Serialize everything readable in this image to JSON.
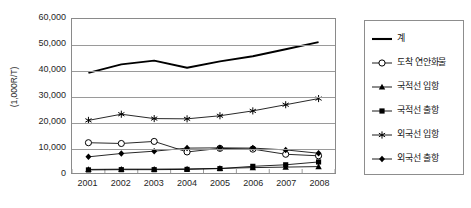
{
  "chart_data": {
    "type": "line",
    "title": "",
    "xlabel": "",
    "ylabel": "(1,000R/T)",
    "categories": [
      "2001",
      "2002",
      "2003",
      "2004",
      "2005",
      "2006",
      "2007",
      "2008"
    ],
    "ylim": [
      0,
      60000
    ],
    "ytick_labels": [
      "60,000",
      "50,000",
      "40,000",
      "30,000",
      "20,000",
      "10,000",
      "0"
    ],
    "ytick_values": [
      60000,
      50000,
      40000,
      30000,
      20000,
      10000,
      0
    ],
    "grid": true,
    "legend_position": "right",
    "series": [
      {
        "name": "계",
        "marker": "none",
        "color": "#000000",
        "values": [
          39000,
          42300,
          43800,
          41000,
          43500,
          45500,
          48200,
          51000
        ]
      },
      {
        "name": "도착 연안화물",
        "marker": "open-circle",
        "color": "#000000",
        "values": [
          11800,
          11500,
          12300,
          8200,
          9600,
          9300,
          7300,
          6700
        ]
      },
      {
        "name": "국적선 입항",
        "marker": "filled-triangle",
        "color": "#000000",
        "values": [
          1400,
          1500,
          1500,
          1600,
          1800,
          2100,
          2300,
          2500
        ]
      },
      {
        "name": "국적선 출항",
        "marker": "filled-square",
        "color": "#000000",
        "values": [
          1200,
          1300,
          1300,
          1400,
          1700,
          2600,
          3200,
          4300
        ]
      },
      {
        "name": "외국선 입항",
        "marker": "asterisk",
        "color": "#000000",
        "values": [
          20500,
          22900,
          21200,
          21100,
          22300,
          24200,
          26600,
          29000
        ]
      },
      {
        "name": "외국선 출항",
        "marker": "filled-diamond",
        "color": "#000000",
        "values": [
          6300,
          7600,
          8500,
          9700,
          9800,
          9700,
          9000,
          7700
        ]
      }
    ]
  },
  "legend": {
    "items": [
      {
        "label": "계",
        "marker": "none"
      },
      {
        "label": "도착 연안화물",
        "marker": "open-circle"
      },
      {
        "label": "국적선 입항",
        "marker": "filled-triangle"
      },
      {
        "label": "국적선 출항",
        "marker": "filled-square"
      },
      {
        "label": "외국선 입항",
        "marker": "asterisk"
      },
      {
        "label": "외국선 출항",
        "marker": "filled-diamond"
      }
    ]
  }
}
